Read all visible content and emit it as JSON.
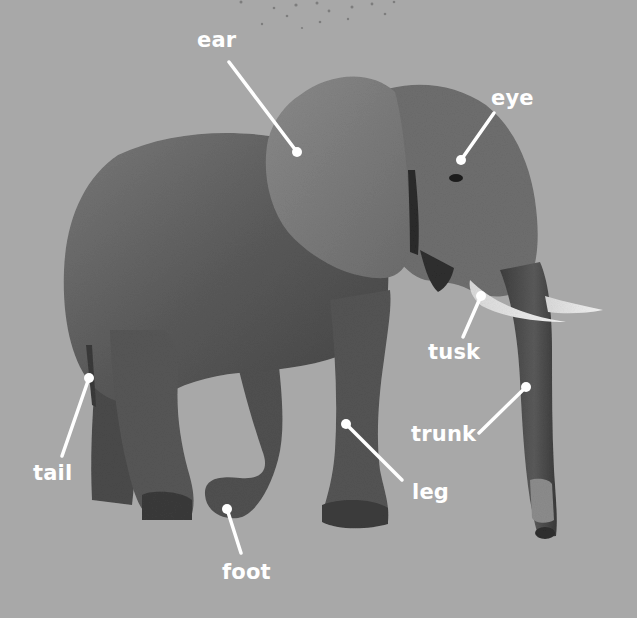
{
  "diagram": {
    "background_color": "#a8a8a8",
    "label_color": "#ffffff",
    "labels": [
      {
        "id": "ear",
        "text": "ear",
        "x": 197,
        "y": 30,
        "line": [
          229,
          62,
          297,
          152
        ]
      },
      {
        "id": "eye",
        "text": "eye",
        "x": 491,
        "y": 88,
        "line": [
          494,
          113,
          461,
          160
        ]
      },
      {
        "id": "tusk",
        "text": "tusk",
        "x": 428,
        "y": 342,
        "line": [
          463,
          337,
          481,
          296
        ]
      },
      {
        "id": "trunk",
        "text": "trunk",
        "x": 411,
        "y": 424,
        "line": [
          479,
          433,
          526,
          387
        ]
      },
      {
        "id": "tail",
        "text": "tail",
        "x": 33,
        "y": 463,
        "line": [
          62,
          456,
          89,
          378
        ]
      },
      {
        "id": "leg",
        "text": "leg",
        "x": 412,
        "y": 482,
        "line": [
          402,
          480,
          346,
          424
        ]
      },
      {
        "id": "foot",
        "text": "foot",
        "x": 222,
        "y": 562,
        "line": [
          241,
          553,
          227,
          509
        ]
      }
    ]
  }
}
